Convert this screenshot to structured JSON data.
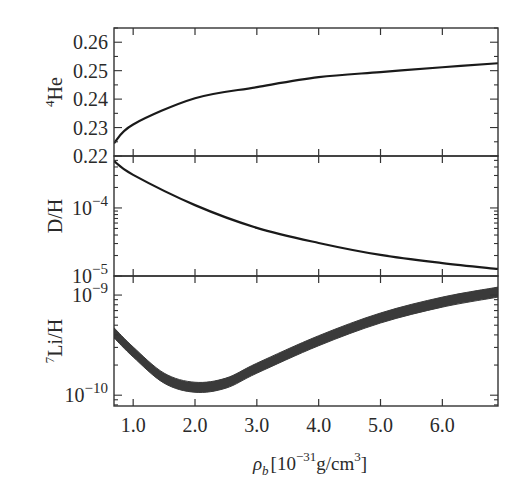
{
  "chart_data": {
    "type": "line",
    "title": "",
    "xlabel": "ρ_b [10^-31 g/cm^3]",
    "xlabel_parts": {
      "symbol": "ρ",
      "sub": "b",
      "pre": "[10",
      "exp": "−31",
      "mid": "g/cm",
      "exp2": "3",
      "post": "]"
    },
    "xlim": [
      0.69,
      6.9
    ],
    "xticks": [
      {
        "value": 1.0,
        "label": "1.0"
      },
      {
        "value": 2.0,
        "label": "2.0"
      },
      {
        "value": 3.0,
        "label": "3.0"
      },
      {
        "value": 4.0,
        "label": "4.0"
      },
      {
        "value": 5.0,
        "label": "5.0"
      },
      {
        "value": 6.0,
        "label": "6.0"
      }
    ],
    "panels": [
      {
        "name": "helium-4",
        "ylabel": "He",
        "ylabel_sup": "4",
        "yscale": "linear",
        "ylim": [
          0.22,
          0.265
        ],
        "yticks": [
          {
            "value": 0.22,
            "label": "0.22"
          },
          {
            "value": 0.23,
            "label": "0.23"
          },
          {
            "value": 0.24,
            "label": "0.24"
          },
          {
            "value": 0.25,
            "label": "0.25"
          },
          {
            "value": 0.26,
            "label": "0.26"
          }
        ],
        "band": false,
        "series": [
          {
            "name": "4He mass fraction",
            "x": [
              0.69,
              1.0,
              2.0,
              3.0,
              4.0,
              5.0,
              6.0,
              6.9
            ],
            "y": [
              0.2245,
              0.2311,
              0.2403,
              0.2442,
              0.2477,
              0.2495,
              0.2512,
              0.2526
            ]
          }
        ]
      },
      {
        "name": "deuterium",
        "ylabel": "D/H",
        "ylabel_sup": "",
        "yscale": "log",
        "ylim": [
          1e-05,
          0.00058
        ],
        "yticks": [
          {
            "value": 1e-05,
            "label_base": "10",
            "label_exp": "−5"
          },
          {
            "value": 0.0001,
            "label_base": "10",
            "label_exp": "−4"
          }
        ],
        "band": false,
        "series": [
          {
            "name": "D/H",
            "x": [
              0.69,
              1.0,
              2.0,
              3.0,
              4.0,
              5.0,
              6.0,
              6.9
            ],
            "y": [
              0.00049,
              0.000306,
              0.00011,
              5.1e-05,
              3.06e-05,
              2.04e-05,
              1.55e-05,
              1.27e-05
            ]
          }
        ]
      },
      {
        "name": "lithium-7",
        "ylabel": "Li/H",
        "ylabel_sup": "7",
        "yscale": "log",
        "ylim": [
          7.8e-11,
          1.55e-09
        ],
        "yticks": [
          {
            "value": 1e-10,
            "label_base": "10",
            "label_exp": "−10"
          },
          {
            "value": 1e-09,
            "label_base": "10",
            "label_exp": "−9"
          }
        ],
        "band": true,
        "band_halfwidth_dex": 0.05,
        "series": [
          {
            "name": "7Li/H",
            "x": [
              0.69,
              1.0,
              1.5,
              2.0,
              2.5,
              3.0,
              4.0,
              5.0,
              6.0,
              6.9
            ],
            "y": [
              4.2e-10,
              2.7e-10,
              1.48e-10,
              1.2e-10,
              1.32e-10,
              1.86e-10,
              3.5e-10,
              5.9e-10,
              8.5e-10,
              1.07e-09
            ]
          }
        ]
      }
    ],
    "colors": {
      "line": "#1a1a1a",
      "band": "#3a3a3a",
      "axis": "#333333",
      "text": "#2a2a2a"
    },
    "grid": false,
    "legend": null
  }
}
